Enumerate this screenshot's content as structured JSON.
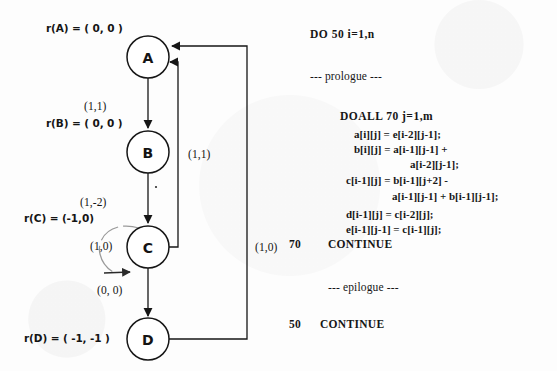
{
  "figure": {
    "kind": "dependence-graph-with-loop-code"
  },
  "graph": {
    "nodes": [
      {
        "id": "A",
        "label": "A",
        "cx": 148,
        "cy": 57,
        "r": 21,
        "annotation": "r(A) = ( 0, 0 )",
        "annot_x": 46,
        "annot_y": 22
      },
      {
        "id": "B",
        "label": "B",
        "cx": 148,
        "cy": 152,
        "r": 21,
        "annotation": "r(B) = ( 0, 0 )",
        "annot_x": 46,
        "annot_y": 117
      },
      {
        "id": "C",
        "label": "C",
        "cx": 148,
        "cy": 247,
        "r": 21,
        "annotation": "r(C) = (-1,0)",
        "annot_x": 24,
        "annot_y": 212
      },
      {
        "id": "D",
        "label": "D",
        "cx": 148,
        "cy": 339,
        "r": 21,
        "annotation": "r(D) = ( -1, -1 )",
        "annot_x": 24,
        "annot_y": 332
      }
    ],
    "edges": [
      {
        "from": "A",
        "to": "B",
        "weight": "(1,1)",
        "label_x": 84,
        "label_y": 100
      },
      {
        "from": "B",
        "to": "C",
        "weight": "(1,-2)",
        "label_x": 80,
        "label_y": 196
      },
      {
        "from": "C",
        "to": "D",
        "weight": "(0, 0)",
        "label_x": 97,
        "label_y": 284
      },
      {
        "from": "C",
        "to": "A",
        "weight": "(1,1)",
        "label_x": 188,
        "label_y": 148
      },
      {
        "from": "D",
        "to": "A",
        "weight": "(1,0)",
        "label_x": 255,
        "label_y": 241
      },
      {
        "from": "C",
        "to": "C",
        "weight": "(1,0)",
        "label_x": 90,
        "label_y": 240,
        "self_loop": true
      }
    ]
  },
  "code": {
    "lines": [
      {
        "text": "DO 50 i=1,n",
        "x": 18,
        "y": 28,
        "style": "kw"
      },
      {
        "text": "--- prologue ---",
        "x": 18,
        "y": 70,
        "style": "comment"
      },
      {
        "text": "DOALL 70 j=1,m",
        "x": 48,
        "y": 110,
        "style": "kw"
      },
      {
        "text": "a[i][j] = e[i-2][j-1];",
        "x": 62,
        "y": 128,
        "style": "stmt"
      },
      {
        "text": "b[i][j] = a[i-1][j-1] +",
        "x": 62,
        "y": 143,
        "style": "stmt"
      },
      {
        "text": "a[i-2][j-1];",
        "x": 118,
        "y": 158,
        "style": "stmt"
      },
      {
        "text": "c[i-1][j] = b[i-1][j+2] -",
        "x": 54,
        "y": 174,
        "style": "stmt"
      },
      {
        "text": "a[i-1][j-1] + b[i-1][j-1];",
        "x": 100,
        "y": 190,
        "style": "stmt"
      },
      {
        "text": "d[i-1][j] = c[i-2][j];",
        "x": 54,
        "y": 208,
        "style": "stmt"
      },
      {
        "text": "e[i-1][j-1] = c[i-1][j];",
        "x": 54,
        "y": 223,
        "style": "stmt"
      },
      {
        "text": "70",
        "x": -3,
        "y": 238,
        "style": "label"
      },
      {
        "text": "CONTINUE",
        "x": 36,
        "y": 238,
        "style": "label"
      },
      {
        "text": "--- epilogue ---",
        "x": 36,
        "y": 281,
        "style": "comment"
      },
      {
        "text": "50",
        "x": -3,
        "y": 318,
        "style": "label"
      },
      {
        "text": "CONTINUE",
        "x": 28,
        "y": 318,
        "style": "label"
      }
    ]
  },
  "colors": {
    "ink": "#161616",
    "paper": "#fdfdfd",
    "faint_ink": "#8d8d8d"
  }
}
